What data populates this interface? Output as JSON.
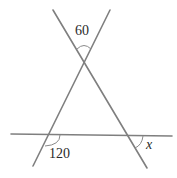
{
  "diagram": {
    "type": "geometry",
    "colors": {
      "line": "#7f7f7f",
      "text": "#2a2a2a",
      "background": "#ffffff"
    },
    "lines": [
      {
        "id": "line-a",
        "x1": 53,
        "y1": 10,
        "x2": 147,
        "y2": 168
      },
      {
        "id": "line-b",
        "x1": 110,
        "y1": 10,
        "x2": 33,
        "y2": 166
      },
      {
        "id": "horizontal",
        "x1": 11,
        "y1": 134,
        "x2": 172,
        "y2": 136
      }
    ],
    "angles": [
      {
        "id": "top",
        "label": "60",
        "x": 75,
        "y": 25
      },
      {
        "id": "bottom-left",
        "label": "120",
        "x": 49,
        "y": 152
      },
      {
        "id": "bottom-right",
        "label": "x",
        "x": 145,
        "y": 140
      }
    ]
  }
}
